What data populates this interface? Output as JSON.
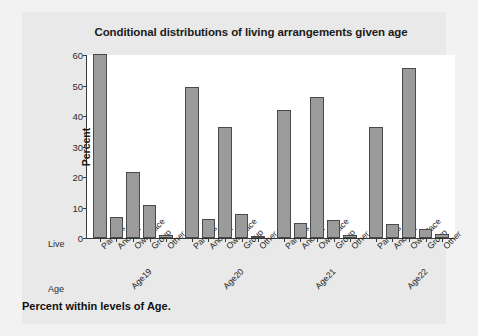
{
  "chart_data": {
    "type": "bar",
    "title": "Conditional distributions of living arrangements given age",
    "xlabel": "",
    "ylabel": "Percent",
    "ylim": [
      0,
      60
    ],
    "yticks": [
      0,
      10,
      20,
      30,
      40,
      50,
      60
    ],
    "grid": false,
    "legend": "none",
    "categories": [
      "Parents",
      "Another",
      "OwnPlace",
      "Group",
      "Other"
    ],
    "group_axis_label": "Age",
    "category_axis_label": "Live",
    "groups": [
      "Age19",
      "Age20",
      "Age21",
      "Age22"
    ],
    "series": [
      {
        "name": "Age19",
        "values": [
          60.2,
          7.0,
          21.5,
          10.9,
          1.0
        ]
      },
      {
        "name": "Age20",
        "values": [
          49.5,
          6.3,
          36.3,
          8.0,
          0.4
        ]
      },
      {
        "name": "Age21",
        "values": [
          42.0,
          5.0,
          46.3,
          5.8,
          1.0
        ]
      },
      {
        "name": "Age22",
        "values": [
          36.4,
          4.5,
          55.6,
          3.0,
          1.2
        ]
      }
    ],
    "annotations": [
      "Percent within levels of Age."
    ],
    "colors": {
      "bar_fill": "#9b9b9b",
      "bar_border": "#4a4a4a",
      "panel_background": "#ffffff",
      "figure_background": "#e9e9e9",
      "axis": "#3a3a3a",
      "text": "#1b1b1b"
    }
  },
  "footer": {
    "note": "Percent within levels of Age."
  }
}
